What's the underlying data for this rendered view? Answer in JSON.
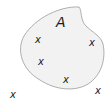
{
  "diagram": {
    "type": "set-diagram",
    "set": {
      "label": "A",
      "fill": "#f2f2f2",
      "stroke": "#9a9a9a"
    },
    "marker_glyph": "x",
    "points_inside": [
      {
        "x": 38,
        "y": 43
      },
      {
        "x": 92,
        "y": 46
      },
      {
        "x": 41,
        "y": 65
      },
      {
        "x": 66,
        "y": 83
      }
    ],
    "points_outside": [
      {
        "x": 13,
        "y": 98
      },
      {
        "x": 98,
        "y": 94
      }
    ]
  }
}
